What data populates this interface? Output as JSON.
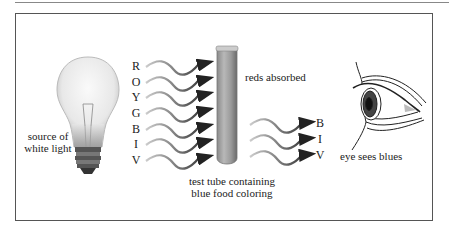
{
  "diagram": {
    "spectrum_in": [
      "R",
      "O",
      "Y",
      "G",
      "B",
      "I",
      "V"
    ],
    "spectrum_out": [
      "B",
      "I",
      "V"
    ],
    "labels": {
      "source": [
        "source of",
        "white light"
      ],
      "absorbed": "reds absorbed",
      "tube": [
        "test tube containing",
        "blue food coloring"
      ],
      "eye": "eye sees blues"
    },
    "icons": {
      "bulb": "light-bulb-icon",
      "tube": "test-tube-icon",
      "eye": "eye-icon",
      "wave": "wavy-arrow-icon"
    },
    "colors": {
      "frame": "#555555",
      "tube": "#9a9a9a",
      "wave": "#444444"
    }
  }
}
